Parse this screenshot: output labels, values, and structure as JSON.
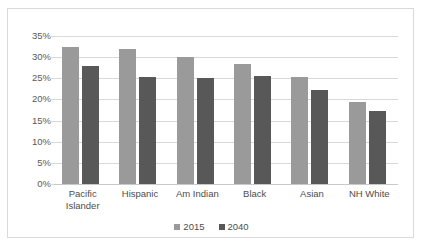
{
  "chart_data": {
    "type": "bar",
    "title": "",
    "subtitle": "",
    "xlabel": "",
    "ylabel": "",
    "categories": [
      "Pacific Islander",
      "Hispanic",
      "Am Indian",
      "Black",
      "Asian",
      "NH White"
    ],
    "category_lines": [
      [
        "Pacific",
        "Islander"
      ],
      [
        "Hispanic"
      ],
      [
        "Am Indian"
      ],
      [
        "Black"
      ],
      [
        "Asian"
      ],
      [
        "NH White"
      ]
    ],
    "series": [
      {
        "name": "2015",
        "color": "#9a9a9a",
        "values": [
          32.5,
          32.0,
          30.0,
          28.5,
          25.2,
          19.4
        ]
      },
      {
        "name": "2040",
        "color": "#585858",
        "values": [
          28.0,
          25.3,
          25.1,
          25.5,
          22.2,
          17.3
        ]
      }
    ],
    "ylim": [
      0,
      35
    ],
    "ytick_values": [
      0,
      5,
      10,
      15,
      20,
      25,
      30,
      35
    ],
    "ytick_labels": [
      "0%",
      "5%",
      "10%",
      "15%",
      "20%",
      "25%",
      "30%",
      "35%"
    ],
    "grid": true,
    "legend_position": "bottom",
    "legend": [
      {
        "label": "2015",
        "color": "#9a9a9a"
      },
      {
        "label": "2040",
        "color": "#585858"
      }
    ],
    "value_unit": "percent",
    "gridline_color": "#d9d9d9",
    "border_color": "#d9d9d9",
    "background_color": "#ffffff",
    "axis_text_color": "#5a5a5a"
  }
}
